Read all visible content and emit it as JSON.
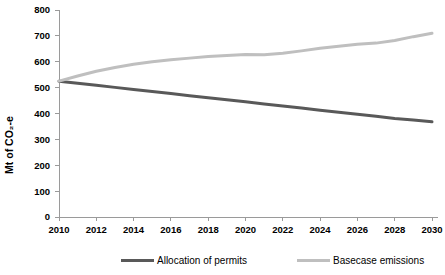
{
  "chart_data": {
    "type": "line",
    "title": "",
    "xlabel": "",
    "ylabel": "Mt of CO₂-e",
    "ylim": [
      0,
      800
    ],
    "xlim": [
      2010,
      2030
    ],
    "yticks": [
      0,
      100,
      200,
      300,
      400,
      500,
      600,
      700,
      800
    ],
    "ytick_labels": [
      "0",
      "100",
      "200",
      "300",
      "400",
      "500",
      "600",
      "700",
      "800"
    ],
    "xticks": [
      2010,
      2012,
      2014,
      2016,
      2018,
      2020,
      2022,
      2024,
      2026,
      2028,
      2030
    ],
    "xtick_labels": [
      "2010",
      "2012",
      "2014",
      "2016",
      "2018",
      "2020",
      "2022",
      "2024",
      "2026",
      "2028",
      "2030"
    ],
    "x": [
      2010,
      2011,
      2012,
      2013,
      2014,
      2015,
      2016,
      2017,
      2018,
      2019,
      2020,
      2021,
      2022,
      2023,
      2024,
      2025,
      2026,
      2027,
      2028,
      2029,
      2030
    ],
    "grid": false,
    "legend_position": "bottom",
    "series": [
      {
        "name": "Allocation of permits",
        "color": "#595959",
        "width": 3.0,
        "values": [
          525,
          517,
          509,
          501,
          493,
          485,
          477,
          469,
          461,
          453,
          445,
          437,
          429,
          421,
          413,
          405,
          397,
          389,
          381,
          375,
          368
        ]
      },
      {
        "name": "Basecase emissions",
        "color": "#bfbfbf",
        "width": 3.0,
        "values": [
          525,
          545,
          563,
          578,
          590,
          600,
          608,
          614,
          620,
          624,
          628,
          627,
          633,
          642,
          652,
          660,
          668,
          672,
          682,
          697,
          710
        ]
      }
    ]
  },
  "axis": {
    "line_color": "#9a9a9a",
    "tick_color": "#9a9a9a"
  },
  "legend": {
    "items": [
      {
        "label": "Allocation of permits",
        "color": "#595959"
      },
      {
        "label": "Basecase emissions",
        "color": "#bfbfbf"
      }
    ]
  }
}
